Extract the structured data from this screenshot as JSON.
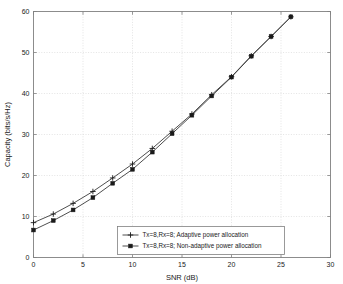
{
  "figure": {
    "name": "mimo-capacity-vs-snr-plot",
    "background": "#ffffff",
    "frame_color": "#808080",
    "grid_color": "#d9d9d9",
    "line_color": "#3a3a3a",
    "marker_color": "#1a1a1a"
  },
  "chart_data": {
    "type": "line",
    "title": "",
    "xlabel": "SNR (dB)",
    "ylabel": "Capacity (bits/s/Hz)",
    "xlim": [
      0,
      30
    ],
    "ylim": [
      0,
      60
    ],
    "xticks": [
      0,
      5,
      10,
      15,
      20,
      25,
      30
    ],
    "yticks": [
      0,
      10,
      20,
      30,
      40,
      50,
      60
    ],
    "xticklabels": [
      "0",
      "5",
      "10",
      "15",
      "20",
      "25",
      "30"
    ],
    "yticklabels": [
      "0",
      "10",
      "20",
      "30",
      "40",
      "50",
      "60"
    ],
    "grid": true,
    "legend_position": "lower center",
    "x": [
      0,
      2,
      4,
      6,
      8,
      10,
      12,
      14,
      16,
      18,
      20,
      22,
      24,
      26
    ],
    "series": [
      {
        "name": "Tx=8,Rx=8; Adaptive power allocation",
        "marker": "plus",
        "values": [
          8.5,
          10.6,
          13.2,
          16.1,
          19.4,
          22.8,
          26.6,
          30.8,
          35.0,
          39.7,
          44.1,
          49.2,
          53.9,
          58.7
        ]
      },
      {
        "name": "Tx=8,Rx=8; Non-adaptive power allocation",
        "marker": "square",
        "values": [
          6.7,
          9.0,
          11.6,
          14.6,
          18.1,
          21.5,
          25.7,
          30.2,
          34.7,
          39.4,
          44.0,
          49.1,
          53.9,
          58.7
        ]
      }
    ]
  },
  "legend": {
    "items": [
      {
        "label": "Tx=8,Rx=8; Adaptive power allocation",
        "marker": "plus"
      },
      {
        "label": "Tx=8,Rx=8; Non-adaptive power allocation",
        "marker": "square"
      }
    ]
  }
}
